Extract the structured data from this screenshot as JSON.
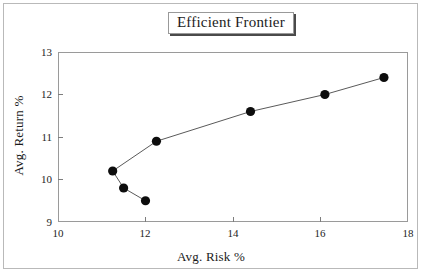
{
  "chart_data": {
    "type": "line",
    "title": "Efficient Frontier",
    "xlabel": "Avg. Risk %",
    "ylabel": "Avg. Return %",
    "xlim": [
      10,
      18
    ],
    "ylim": [
      9,
      13
    ],
    "xticks": [
      "10",
      "12",
      "14",
      "16",
      "18"
    ],
    "yticks": [
      "9",
      "10",
      "11",
      "12",
      "13"
    ],
    "xtick_values": [
      10,
      12,
      14,
      16,
      18
    ],
    "ytick_values": [
      9,
      10,
      11,
      12,
      13
    ],
    "grid": false,
    "legend": "none",
    "marker": "filled-circle",
    "marker_color": "#0d0d0d",
    "line_color": "#5a5a5a",
    "series": [
      {
        "name": "Efficient Frontier",
        "x": [
          11.25,
          11.5,
          12.0,
          12.25,
          14.4,
          16.1,
          17.45
        ],
        "y": [
          10.2,
          9.8,
          9.5,
          10.9,
          11.6,
          12.0,
          12.4
        ],
        "path_order": [
          2,
          1,
          0,
          3,
          4,
          5,
          6
        ]
      }
    ]
  },
  "figure": {
    "title": "Efficient Frontier"
  }
}
